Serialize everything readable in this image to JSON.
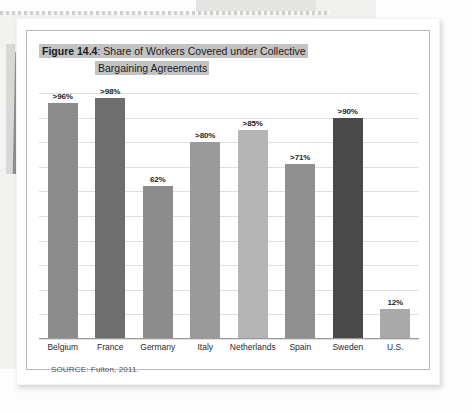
{
  "document": {
    "sheet_label": "scanned-textbook-page",
    "source_note": "SOURCE: Fulton, 2011."
  },
  "figure": {
    "number_label": "Figure 14.4",
    "title_separator": ": ",
    "title_line1": "Share of Workers Covered under Collective",
    "title_line2": "Bargaining Agreements",
    "title_highlight_color": "#c3c3c3",
    "frame_border_color": "#b9b9b9"
  },
  "chart_data": {
    "type": "bar",
    "title": "Figure 14.4: Share of Workers Covered under Collective Bargaining Agreements",
    "xlabel": "",
    "ylabel": "",
    "ylim": [
      0,
      100
    ],
    "grid": true,
    "gridline_count": 10,
    "legend": "none",
    "categories": [
      "Belgium",
      "France",
      "Germany",
      "Italy",
      "Netherlands",
      "Spain",
      "Sweden",
      "U.S."
    ],
    "values": [
      96,
      98,
      62,
      80,
      85,
      71,
      90,
      12
    ],
    "value_labels": [
      ">96%",
      ">98%",
      "62%",
      ">80%",
      ">85%",
      ">71%",
      ">90%",
      "12%"
    ],
    "bar_colors": [
      "#8c8c8c",
      "#6e6e6e",
      "#8c8c8c",
      "#9a9a9a",
      "#b5b5b5",
      "#909090",
      "#4a4a4a",
      "#a9a9a9"
    ],
    "source": "SOURCE: Fulton, 2011."
  }
}
